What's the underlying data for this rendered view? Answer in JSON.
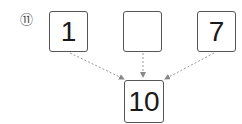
{
  "problem": {
    "number_label": "⑪"
  },
  "diagram": {
    "top_boxes": [
      {
        "value": "1"
      },
      {
        "value": ""
      },
      {
        "value": "7"
      }
    ],
    "bottom_box": {
      "value": "10"
    },
    "arrow_color": "#888888",
    "arrow_style": "dashed"
  }
}
